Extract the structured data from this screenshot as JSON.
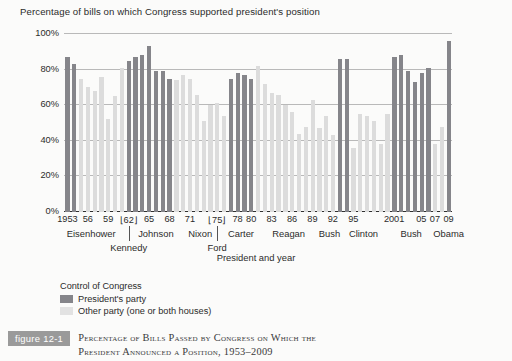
{
  "chart": {
    "title": "Percentage of bills on which Congress supported president's position",
    "xlabel": "President and year",
    "caption": {
      "badge": "figure 12-1",
      "line1": "Percentage of Bills Passed by Congress on Which the",
      "line2": "President Announced a Position, 1953–2009"
    },
    "legend": {
      "title": "Control of Congress",
      "items": [
        {
          "label": "President's party",
          "key": "pres"
        },
        {
          "label": "Other party (one or both houses)",
          "key": "other"
        }
      ]
    },
    "ytick_labels": [
      "0%",
      "20%",
      "40%",
      "60%",
      "80%",
      "100%"
    ],
    "year_ticks": [
      {
        "label": "1953",
        "index": 0
      },
      {
        "label": "56",
        "index": 3
      },
      {
        "label": "59",
        "index": 6
      },
      {
        "label": "62",
        "index": 9,
        "bracket": true
      },
      {
        "label": "65",
        "index": 12
      },
      {
        "label": "68",
        "index": 15
      },
      {
        "label": "71",
        "index": 18
      },
      {
        "label": "75",
        "index": 22,
        "bracket": true
      },
      {
        "label": "78",
        "index": 25
      },
      {
        "label": "80",
        "index": 27
      },
      {
        "label": "83",
        "index": 30
      },
      {
        "label": "86",
        "index": 33
      },
      {
        "label": "89",
        "index": 36
      },
      {
        "label": "92",
        "index": 39
      },
      {
        "label": "95",
        "index": 42
      },
      {
        "label": "2001",
        "index": 48
      },
      {
        "label": "05",
        "index": 52
      },
      {
        "label": "07",
        "index": 54
      },
      {
        "label": "09",
        "index": 56
      }
    ],
    "presidents": [
      {
        "name": "Eisenhower",
        "index": 3.5,
        "row": "high"
      },
      {
        "name": "Kennedy",
        "index": 9,
        "row": "low"
      },
      {
        "name": "Johnson",
        "index": 13,
        "row": "high"
      },
      {
        "name": "Nixon",
        "index": 19.5,
        "row": "high"
      },
      {
        "name": "Ford",
        "index": 22,
        "row": "low"
      },
      {
        "name": "Carter",
        "index": 25.5,
        "row": "high"
      },
      {
        "name": "Reagan",
        "index": 32.5,
        "row": "high"
      },
      {
        "name": "Bush",
        "index": 38.5,
        "row": "high"
      },
      {
        "name": "Clinton",
        "index": 43.5,
        "row": "high"
      },
      {
        "name": "Bush",
        "index": 50.5,
        "row": "high"
      },
      {
        "name": "Obama",
        "index": 56,
        "row": "high"
      }
    ]
  },
  "chart_data": {
    "type": "bar",
    "title": "Percentage of bills on which Congress supported president's position",
    "xlabel": "President and year",
    "ylabel": "",
    "ylim": [
      0,
      100
    ],
    "yticks": [
      0,
      20,
      40,
      60,
      80,
      100
    ],
    "grid": true,
    "legend_position": "below-left",
    "series_key": "control of Congress: president's party (dark) vs other party (light)",
    "categories": [
      "1953",
      "1954",
      "1955",
      "1956",
      "1957",
      "1958",
      "1959",
      "1960",
      "1961",
      "1962",
      "1963",
      "1964",
      "1965",
      "1966",
      "1967",
      "1968",
      "1969",
      "1970",
      "1971",
      "1972",
      "1973",
      "1974",
      "1975",
      "1976",
      "1977",
      "1978",
      "1979",
      "1980",
      "1981",
      "1982",
      "1983",
      "1984",
      "1985",
      "1986",
      "1987",
      "1988",
      "1989",
      "1990",
      "1991",
      "1992",
      "1993",
      "1994",
      "1995",
      "1996",
      "1997",
      "1998",
      "1999",
      "2000",
      "2001",
      "2002",
      "2003",
      "2004",
      "2005",
      "2006",
      "2007",
      "2008",
      "2009"
    ],
    "values": [
      87,
      83,
      75,
      70,
      68,
      76,
      52,
      65,
      81,
      85,
      87,
      88,
      93,
      79,
      79,
      75,
      74,
      77,
      75,
      66,
      51,
      60,
      61,
      54,
      75,
      78,
      77,
      75,
      82,
      72,
      67,
      66,
      60,
      56,
      44,
      48,
      63,
      47,
      54,
      43,
      86,
      86,
      36,
      55,
      54,
      51,
      38,
      55,
      87,
      88,
      79,
      73,
      78,
      81,
      38,
      48,
      96
    ],
    "control": [
      "pres",
      "pres",
      "other",
      "other",
      "other",
      "other",
      "other",
      "other",
      "other",
      "pres",
      "pres",
      "pres",
      "pres",
      "pres",
      "pres",
      "pres",
      "other",
      "other",
      "other",
      "other",
      "other",
      "other",
      "other",
      "other",
      "pres",
      "pres",
      "pres",
      "pres",
      "other",
      "other",
      "other",
      "other",
      "other",
      "other",
      "other",
      "other",
      "other",
      "other",
      "other",
      "other",
      "pres",
      "pres",
      "other",
      "other",
      "other",
      "other",
      "other",
      "other",
      "pres",
      "pres",
      "pres",
      "pres",
      "pres",
      "pres",
      "other",
      "other",
      "pres"
    ]
  }
}
